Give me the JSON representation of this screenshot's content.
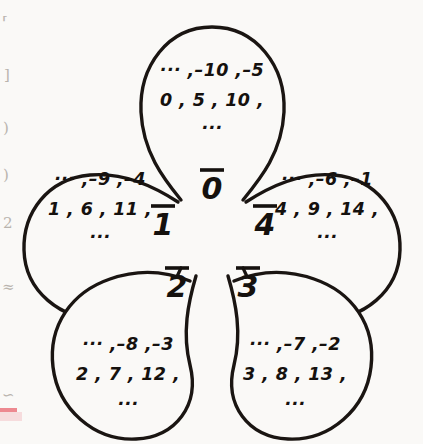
{
  "figure": {
    "modulus": 5,
    "stroke_color": "#1a1512",
    "text_color": "#15110e",
    "background_color": "#faf9f7",
    "accent_color": "#e8636d"
  },
  "petals": [
    {
      "id": "petal-0",
      "position": "top",
      "label": "0",
      "label_overline": true,
      "lines": [
        "··· ,–10 ,–5",
        "0 , 5 , 10 ,",
        "···"
      ],
      "members_negative": [
        -10,
        -5
      ],
      "members_positive": [
        0,
        5,
        10
      ]
    },
    {
      "id": "petal-1",
      "position": "left",
      "label": "1",
      "label_overline": true,
      "lines": [
        "··· ,–9 ,–4",
        "1 , 6 , 11 ,",
        "···"
      ],
      "members_negative": [
        -9,
        -4
      ],
      "members_positive": [
        1,
        6,
        11
      ]
    },
    {
      "id": "petal-2",
      "position": "bottom-left",
      "label": "2",
      "label_overline": true,
      "lines": [
        "··· ,–8 ,–3",
        "2 , 7 , 12 ,",
        "···"
      ],
      "members_negative": [
        -8,
        -3
      ],
      "members_positive": [
        2,
        7,
        12
      ]
    },
    {
      "id": "petal-3",
      "position": "bottom-right",
      "label": "3",
      "label_overline": true,
      "lines": [
        "··· ,–7 ,–2",
        "3 , 8 , 13 ,",
        "···"
      ],
      "members_negative": [
        -7,
        -2
      ],
      "members_positive": [
        3,
        8,
        13
      ]
    },
    {
      "id": "petal-4",
      "position": "right",
      "label": "4",
      "label_overline": true,
      "lines": [
        "··· ,–6 ,–1",
        "4 , 9 , 14 ,",
        "···"
      ],
      "members_negative": [
        -6,
        -1
      ],
      "members_positive": [
        4,
        9,
        14
      ]
    }
  ],
  "margin_fragments": [
    {
      "id": "frag-1",
      "text": "⸢"
    },
    {
      "id": "frag-2",
      "text": "]"
    },
    {
      "id": "frag-3",
      "text": ")"
    },
    {
      "id": "frag-4",
      "text": ")"
    },
    {
      "id": "frag-5",
      "text": "2"
    },
    {
      "id": "frag-6",
      "text": "≈"
    },
    {
      "id": "frag-7",
      "text": "∽"
    }
  ]
}
